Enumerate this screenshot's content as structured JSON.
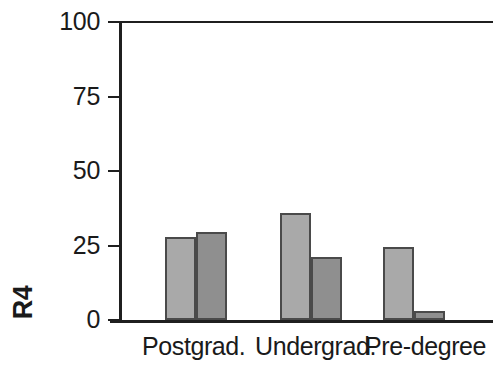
{
  "chart_data": {
    "type": "bar",
    "title": "",
    "xlabel": "",
    "ylabel": "R4",
    "categories": [
      "Postgrad.",
      "Undergrad.",
      "Pre-degree"
    ],
    "series": [
      {
        "name": "Series 1",
        "color": "#a9a9a9",
        "values": [
          28,
          36,
          24.5
        ]
      },
      {
        "name": "Series 2",
        "color": "#8f8f8f",
        "values": [
          29.5,
          21,
          3
        ]
      }
    ],
    "ylim": [
      0,
      100
    ],
    "yticks": [
      0,
      25,
      50,
      75,
      100
    ],
    "ytick_labels": [
      "0",
      "25",
      "50",
      "75",
      "100"
    ],
    "grid": false,
    "legend": "none",
    "frame": {
      "left_axis": true,
      "bottom_axis": true,
      "top_border": true,
      "right_border": false
    },
    "axis_color": "#1f1f1f",
    "bar_edge_color": "#4a4a4a",
    "background": "#ffffff"
  }
}
